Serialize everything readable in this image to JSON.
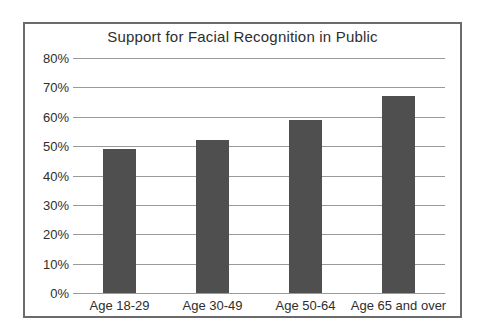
{
  "chart_data": {
    "type": "bar",
    "title": "Support for Facial Recognition in Public",
    "categories": [
      "Age 18-29",
      "Age 30-49",
      "Age 50-64",
      "Age 65 and over"
    ],
    "values": [
      49,
      52,
      59,
      67
    ],
    "xlabel": "",
    "ylabel": "",
    "ylim": [
      0,
      80
    ],
    "ytick_step": 10,
    "ytick_labels": [
      "0%",
      "10%",
      "20%",
      "30%",
      "40%",
      "50%",
      "60%",
      "70%",
      "80%"
    ],
    "grid": true,
    "legend": false,
    "colors": {
      "bar": "#4f4f4f",
      "gridline": "#9a9a9a",
      "frame_border": "#6b6b6b",
      "text": "#2e2e2e",
      "background": "#ffffff"
    }
  }
}
